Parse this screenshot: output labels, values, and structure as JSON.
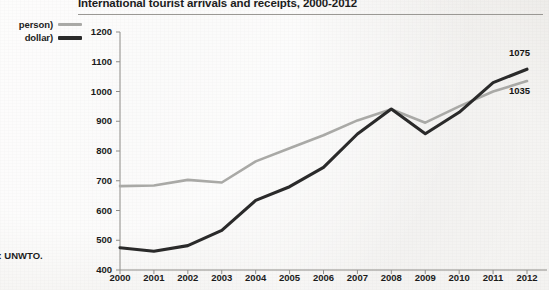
{
  "chart_data": {
    "type": "line",
    "title": "International tourist arrivals and receipts, 2000-2012",
    "xlabel": "",
    "ylabel": "",
    "ylim": [
      400,
      1200
    ],
    "ytick_step": 100,
    "yticks": [
      "1200",
      "1100",
      "1000",
      "900",
      "800",
      "700",
      "600",
      "500",
      "400"
    ],
    "categories": [
      "2000",
      "2001",
      "2002",
      "2003",
      "2004",
      "2005",
      "2006",
      "2007",
      "2008",
      "2009",
      "2010",
      "2011",
      "2012"
    ],
    "grid": false,
    "legend_position": "left-outside",
    "series": [
      {
        "name": "arrivals",
        "legend_label": "person)",
        "color": "#a9a9a6",
        "end_label": "1035",
        "values": [
          682,
          684,
          703,
          694,
          765,
          809,
          853,
          903,
          940,
          895,
          950,
          1000,
          1035
        ]
      },
      {
        "name": "receipts",
        "legend_label": "dollar)",
        "color": "#2a2a2a",
        "end_label": "1075",
        "values": [
          475,
          463,
          482,
          533,
          634,
          680,
          745,
          857,
          941,
          858,
          930,
          1030,
          1075
        ]
      }
    ],
    "annotations": [
      {
        "name": "end-label-receipts",
        "text": "1075"
      },
      {
        "name": "end-label-arrivals",
        "text": "1035"
      }
    ]
  },
  "source": {
    "text": "ce:  UNWTO."
  }
}
